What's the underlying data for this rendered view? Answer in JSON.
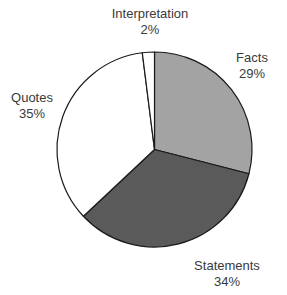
{
  "chart_data": {
    "type": "pie",
    "title": "",
    "categories": [
      "Facts",
      "Statements",
      "Quotes",
      "Interpretation"
    ],
    "values": [
      29,
      34,
      35,
      2
    ],
    "unit": "%",
    "start_angle_deg": 0,
    "direction": "clockwise",
    "colors": [
      "#a3a3a3",
      "#5a5a5a",
      "#ffffff",
      "#ffffff"
    ],
    "outline_color": "#1a1a1a",
    "legend": "none (labels placed outside slices)",
    "labels": [
      {
        "name": "Facts",
        "pct": "29%"
      },
      {
        "name": "Statements",
        "pct": "34%"
      },
      {
        "name": "Quotes",
        "pct": "35%"
      },
      {
        "name": "Interpretation",
        "pct": "2%"
      }
    ]
  }
}
